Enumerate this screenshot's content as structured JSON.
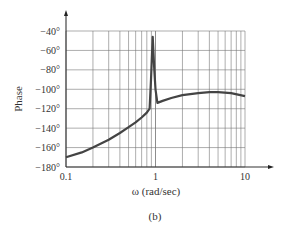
{
  "chart_data": {
    "type": "line",
    "title": "",
    "caption": "(b)",
    "xlabel": "ω (rad/sec)",
    "ylabel": "Phase",
    "xscale": "log",
    "xlim": [
      0.1,
      10
    ],
    "ylim": [
      -180,
      -40
    ],
    "grid": true,
    "legend": null,
    "x_tick_labels": [
      "0.1",
      "1",
      "10"
    ],
    "y_tick_labels": [
      "−40°",
      "−60°",
      "−80°",
      "−100°",
      "−120°",
      "−140°",
      "−160°",
      "−180°"
    ],
    "y_ticks": [
      -40,
      -60,
      -80,
      -100,
      -120,
      -140,
      -160,
      -180
    ],
    "series": [
      {
        "name": "Phase",
        "color": "#444444",
        "x": [
          0.1,
          0.15,
          0.2,
          0.3,
          0.4,
          0.5,
          0.6,
          0.7,
          0.8,
          0.86,
          0.89,
          0.93,
          0.97,
          1.0,
          1.05,
          1.2,
          1.5,
          2.0,
          3.0,
          4.0,
          5.0,
          7.0,
          10.0
        ],
        "values": [
          -170,
          -165,
          -160,
          -152,
          -145,
          -139,
          -134,
          -129,
          -124,
          -120,
          -90,
          -46,
          -80,
          -100,
          -114,
          -112,
          -109,
          -106,
          -104,
          -103,
          -103,
          -104,
          -107
        ]
      }
    ]
  },
  "labels": {
    "ylabel": "Phase",
    "xlabel": "ω (rad/sec)",
    "caption": "(b)",
    "xticks": [
      "0.1",
      "1",
      "10"
    ],
    "yticks": [
      "−40°",
      "−60°",
      "−80°",
      "−100°",
      "−120°",
      "−140°",
      "−160°",
      "−180°"
    ]
  }
}
